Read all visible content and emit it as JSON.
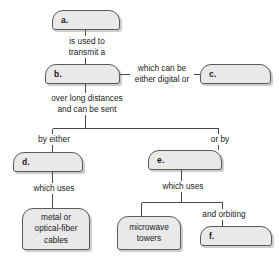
{
  "diagram": {
    "type": "concept-map",
    "nodes": [
      {
        "id": "a",
        "kind": "blank-slot",
        "label": "a."
      },
      {
        "id": "b",
        "kind": "blank-slot",
        "label": "b."
      },
      {
        "id": "c",
        "kind": "blank-slot",
        "label": "c."
      },
      {
        "id": "d",
        "kind": "blank-slot",
        "label": "d."
      },
      {
        "id": "e",
        "kind": "blank-slot",
        "label": "e."
      },
      {
        "id": "f",
        "kind": "blank-slot",
        "label": "f."
      },
      {
        "id": "cables",
        "kind": "filled",
        "label": "metal or\noptical-fiber\ncables"
      },
      {
        "id": "towers",
        "kind": "filled",
        "label": "microwave\ntowers"
      }
    ],
    "edge_labels": [
      {
        "id": "a-b",
        "text": "is used to\ntransmit a"
      },
      {
        "id": "b-c",
        "text": "which can be\neither digital or"
      },
      {
        "id": "b-fork",
        "text": "over long distances\nand can be sent"
      },
      {
        "id": "fork-d",
        "text": "by either"
      },
      {
        "id": "fork-e",
        "text": "or by"
      },
      {
        "id": "d-cables",
        "text": "which uses"
      },
      {
        "id": "e-fork",
        "text": "which uses"
      },
      {
        "id": "e-f",
        "text": "and orbiting"
      }
    ],
    "colors": {
      "box_fill": "#e9e9e9",
      "box_border": "#5a5a5a",
      "line": "#4a4a4a",
      "text": "#1a1a1a",
      "background": "#ffffff"
    }
  }
}
